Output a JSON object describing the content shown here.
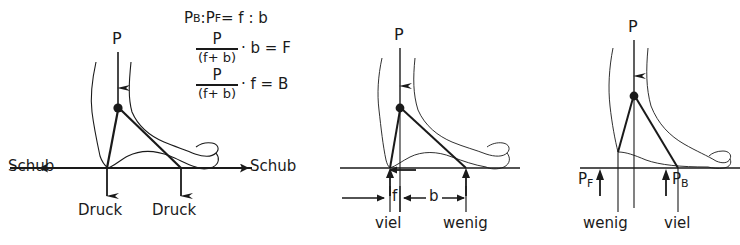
{
  "figure": {
    "background_color": "#ffffff",
    "ink_color": "#1a1a1a"
  },
  "formula": {
    "line1": {
      "p_b": "P",
      "p_b_sub": "B",
      "colon1": " : ",
      "p_f": "P",
      "p_f_sub": "F",
      "equals": " = f : b",
      "full_text": "PB : PF = f : b"
    },
    "line2": {
      "numerator": "P",
      "denominator": "(f+ b)",
      "rest": "· b = F",
      "full_text": "P/(f+b) · b = F"
    },
    "line3": {
      "numerator": "P",
      "denominator": "(f+ b)",
      "rest": "· f = B",
      "full_text": "P/(f+b) · f = B"
    }
  },
  "panels": [
    {
      "id": "left",
      "load_label": "P",
      "shear_label_left": "Schub",
      "shear_label_right": "Schub",
      "pressure_label_front": "Druck",
      "pressure_label_rear": "Druck"
    },
    {
      "id": "middle",
      "load_label": "P",
      "dim_front": "f",
      "dim_rear": "b",
      "amount_front": "viel",
      "amount_rear": "wenig"
    },
    {
      "id": "right",
      "load_label": "P",
      "reaction_front": "P",
      "reaction_front_sub": "F",
      "reaction_rear": "P",
      "reaction_rear_sub": "B",
      "amount_front": "wenig",
      "amount_rear": "viel"
    }
  ]
}
